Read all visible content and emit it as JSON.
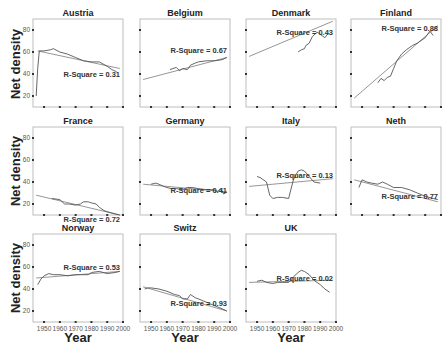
{
  "chart_data": {
    "type": "line",
    "layout": "small-multiples 3x4",
    "xlabel": "Year",
    "ylabel": "Net density",
    "xlim": [
      1943,
      2000
    ],
    "ylim": [
      10,
      90
    ],
    "xticks": [
      1950,
      1960,
      1970,
      1980,
      1990,
      2000
    ],
    "yticks": [
      20,
      40,
      60,
      80
    ],
    "grid": false,
    "legend": "none",
    "panels": [
      {
        "name": "Austria",
        "r_square": "R-Square = 0.31",
        "series": {
          "x": [
            1945,
            1946,
            1947,
            1950,
            1954,
            1956,
            1960,
            1965,
            1970,
            1975,
            1980,
            1985,
            1990,
            1993,
            1996
          ],
          "y": [
            20,
            45,
            61,
            61,
            62,
            63,
            60,
            58,
            55,
            52,
            51,
            51,
            47,
            44,
            42
          ]
        },
        "fit": {
          "x": [
            1946,
            1998
          ],
          "y": [
            61,
            45
          ]
        },
        "label_pos": [
          0.55,
          0.62
        ]
      },
      {
        "name": "Belgium",
        "r_square": "R-Square = 0.67",
        "series": {
          "x": [
            1962,
            1966,
            1968,
            1970,
            1973,
            1975,
            1978,
            1980,
            1985,
            1990,
            1995,
            1998
          ],
          "y": [
            44,
            46,
            43,
            45,
            44,
            48,
            50,
            51,
            52,
            52,
            53,
            55
          ]
        },
        "fit": {
          "x": [
            1945,
            1998
          ],
          "y": [
            35,
            55
          ]
        },
        "label_pos": [
          0.45,
          0.35
        ]
      },
      {
        "name": "Denmark",
        "r_square": "R-Square = 0.43",
        "series": {
          "x": [
            1976,
            1978,
            1980,
            1981,
            1983,
            1985,
            1988,
            1991,
            1993,
            1995
          ],
          "y": [
            60,
            62,
            63,
            66,
            68,
            74,
            78,
            75,
            73,
            77
          ]
        },
        "fit": {
          "x": [
            1945,
            1998
          ],
          "y": [
            56,
            88
          ]
        },
        "label_pos": [
          0.45,
          0.15
        ]
      },
      {
        "name": "Finland",
        "r_square": "R-Square = 0.88",
        "series": {
          "x": [
            1960,
            1962,
            1964,
            1966,
            1968,
            1970,
            1972,
            1975,
            1978,
            1980,
            1982,
            1985,
            1990,
            1993,
            1995
          ],
          "y": [
            32,
            36,
            34,
            37,
            38,
            45,
            52,
            58,
            62,
            64,
            66,
            68,
            73,
            79,
            75
          ]
        },
        "fit": {
          "x": [
            1945,
            1998
          ],
          "y": [
            18,
            84
          ]
        },
        "label_pos": [
          0.45,
          0.1
        ]
      },
      {
        "name": "France",
        "r_square": "R-Square = 0.72",
        "series": {
          "x": [
            1955,
            1960,
            1963,
            1966,
            1970,
            1973,
            1975,
            1978,
            1980,
            1983,
            1985,
            1988,
            1990,
            1995,
            1998
          ],
          "y": [
            25,
            24,
            20,
            20,
            19,
            20,
            22,
            22,
            21,
            20,
            17,
            14,
            13,
            11,
            10
          ]
        },
        "fit": {
          "x": [
            1945,
            1998
          ],
          "y": [
            28,
            10
          ]
        },
        "label_pos": [
          0.45,
          1.05
        ]
      },
      {
        "name": "Germany",
        "r_square": "R-Square = 0.41",
        "series": {
          "x": [
            1950,
            1953,
            1955,
            1958,
            1960,
            1963,
            1966,
            1970,
            1973,
            1976,
            1980,
            1985,
            1990,
            1992,
            1994,
            1996,
            1998
          ],
          "y": [
            38,
            39,
            38,
            36,
            35,
            34,
            34,
            33,
            35,
            35,
            34,
            33,
            33,
            31,
            34,
            29,
            31
          ]
        },
        "fit": {
          "x": [
            1945,
            1998
          ],
          "y": [
            38,
            31
          ]
        },
        "label_pos": [
          0.45,
          0.72
        ]
      },
      {
        "name": "Italy",
        "r_square": "R-Square = 0.13",
        "series": {
          "x": [
            1950,
            1952,
            1956,
            1958,
            1960,
            1963,
            1966,
            1970,
            1973,
            1976,
            1978,
            1980,
            1983,
            1986,
            1990
          ],
          "y": [
            45,
            44,
            40,
            28,
            25,
            26,
            26,
            25,
            42,
            50,
            51,
            50,
            45,
            40,
            39
          ]
        },
        "fit": {
          "x": [
            1945,
            1998
          ],
          "y": [
            36,
            43
          ]
        },
        "label_pos": [
          0.45,
          0.55
        ]
      },
      {
        "name": "Neth",
        "r_square": "R-Square = 0.77",
        "series": {
          "x": [
            1948,
            1950,
            1953,
            1956,
            1960,
            1963,
            1966,
            1970,
            1975,
            1980,
            1985,
            1990,
            1995,
            1998
          ],
          "y": [
            35,
            42,
            40,
            39,
            38,
            40,
            38,
            35,
            35,
            33,
            30,
            27,
            25,
            24
          ]
        },
        "fit": {
          "x": [
            1945,
            1998
          ],
          "y": [
            42,
            22
          ]
        },
        "label_pos": [
          0.45,
          0.78
        ]
      },
      {
        "name": "Norway",
        "r_square": "R-Square = 0.53",
        "series": {
          "x": [
            1946,
            1948,
            1950,
            1953,
            1956,
            1960,
            1965,
            1970,
            1975,
            1978,
            1980,
            1985,
            1990,
            1995,
            1998
          ],
          "y": [
            44,
            49,
            52,
            54,
            53,
            53,
            52,
            53,
            53,
            53,
            55,
            56,
            54,
            55,
            56
          ]
        },
        "fit": {
          "x": [
            1945,
            1998
          ],
          "y": [
            50,
            56
          ]
        },
        "label_pos": [
          0.45,
          0.38
        ]
      },
      {
        "name": "Switz",
        "r_square": "R-Square = 0.93",
        "series": {
          "x": [
            1946,
            1948,
            1950,
            1955,
            1960,
            1965,
            1968,
            1970,
            1973,
            1975,
            1978,
            1980,
            1985,
            1990,
            1995,
            1998
          ],
          "y": [
            40,
            41,
            41,
            40,
            38,
            35,
            34,
            31,
            31,
            35,
            32,
            31,
            28,
            25,
            22,
            20
          ]
        },
        "fit": {
          "x": [
            1945,
            1998
          ],
          "y": [
            42,
            20
          ]
        },
        "label_pos": [
          0.45,
          0.78
        ]
      },
      {
        "name": "UK",
        "r_square": "R-Square = 0.02",
        "series": {
          "x": [
            1950,
            1953,
            1956,
            1960,
            1963,
            1966,
            1970,
            1973,
            1976,
            1978,
            1980,
            1983,
            1986,
            1990,
            1993,
            1996
          ],
          "y": [
            47,
            48,
            46,
            45,
            46,
            46,
            46,
            51,
            55,
            57,
            56,
            53,
            48,
            44,
            40,
            37
          ]
        },
        "fit": {
          "x": [
            1945,
            1998
          ],
          "y": [
            46,
            48
          ]
        },
        "label_pos": [
          0.45,
          0.5
        ]
      }
    ]
  }
}
